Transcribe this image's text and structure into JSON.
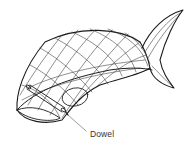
{
  "diagram": {
    "labels": [
      {
        "text": "Dowel"
      }
    ],
    "colors": {
      "line": "#1a1a1a",
      "mesh": "#333333",
      "background": "#ffffff"
    }
  }
}
